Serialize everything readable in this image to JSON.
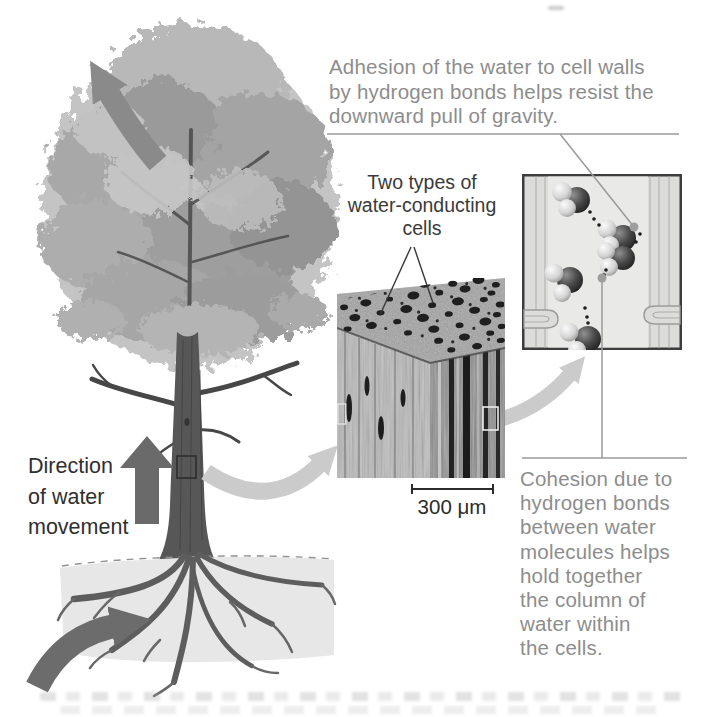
{
  "figure": {
    "topic": "Water movement in a tree: adhesion and cohesion in water-conducting cells",
    "labels": {
      "adhesion_caption": {
        "lines": [
          "Adhesion of the water to cell walls",
          "by hydrogen bonds helps resist the",
          "downward pull of gravity."
        ],
        "color": "#8d8d8d"
      },
      "two_types_label": {
        "lines": [
          "Two types of",
          "water-conducting",
          "cells"
        ],
        "color": "#3a3a3a"
      },
      "direction_label": {
        "lines": [
          "Direction",
          "of water",
          "movement"
        ],
        "color": "#2f2f2f"
      },
      "scale_bar": {
        "text": "300 μm",
        "color": "#2c2c2c"
      },
      "cohesion_caption": {
        "lines": [
          "Cohesion due to",
          "hydrogen bonds",
          "between water",
          "molecules helps",
          "hold together",
          "the column of",
          "water within",
          "the cells."
        ],
        "color": "#8d8d8d"
      }
    },
    "artwork": {
      "up_arrow_color": "#6a6a6a",
      "curved_arrow_top_color": "#8a8a8a",
      "curved_arrow_bottom_color": "#6c6c6c",
      "connector_arrow_color": "#cbcbcb",
      "callout_line_color": "#9a9a9a",
      "pointer_line_color": "#383838",
      "soil_color": "#e7e7e7",
      "panel_border_color": "#3d3d3d",
      "oxygen_atom_color": "#3a3a3a",
      "hydrogen_atom_color": "#dddddd",
      "hydrogen_bond_dot_color": "#1c1c1c",
      "water_molecule_count": 5
    }
  }
}
